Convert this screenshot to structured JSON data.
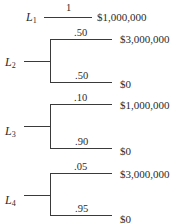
{
  "lotteries": [
    {
      "name": "L",
      "index": "1",
      "branches": [
        {
          "probability": "1",
          "payoff": "$1,000,000"
        }
      ]
    },
    {
      "name": "L",
      "index": "2",
      "branches": [
        {
          "probability": ".50",
          "payoff": "$3,000,000"
        },
        {
          "probability": ".50",
          "payoff": "$0"
        }
      ]
    },
    {
      "name": "L",
      "index": "3",
      "branches": [
        {
          "probability": ".10",
          "payoff": "$1,000,000"
        },
        {
          "probability": ".90",
          "payoff": "$0"
        }
      ]
    },
    {
      "name": "L",
      "index": "4",
      "branches": [
        {
          "probability": ".05",
          "payoff": "$3,000,000"
        },
        {
          "probability": ".95",
          "payoff": "$0"
        }
      ]
    }
  ]
}
